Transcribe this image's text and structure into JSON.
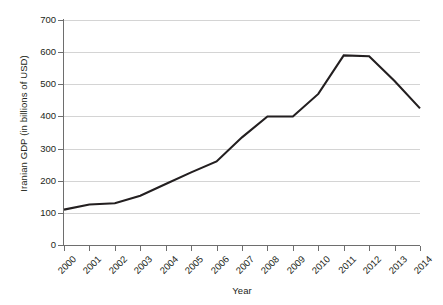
{
  "chart_data": {
    "type": "line",
    "title": "",
    "xlabel": "Year",
    "ylabel": "Iranian GDP (in billions of USD)",
    "categories": [
      "2000",
      "2001",
      "2002",
      "2003",
      "2004",
      "2005",
      "2006",
      "2007",
      "2008",
      "2009",
      "2010",
      "2011",
      "2012",
      "2013",
      "2014"
    ],
    "x": [
      2000,
      2001,
      2002,
      2003,
      2004,
      2005,
      2006,
      2007,
      2008,
      2009,
      2010,
      2011,
      2012,
      2013,
      2014
    ],
    "values": [
      110,
      126,
      130,
      153,
      190,
      226,
      260,
      335,
      400,
      400,
      470,
      590,
      587,
      510,
      425
    ],
    "series": [
      {
        "name": "Iranian GDP",
        "values": [
          110,
          126,
          130,
          153,
          190,
          226,
          260,
          335,
          400,
          400,
          470,
          590,
          587,
          510,
          425
        ]
      }
    ],
    "ylim": [
      0,
      700
    ],
    "yticks": [
      0,
      100,
      200,
      300,
      400,
      500,
      600,
      700
    ],
    "ytick_labels": [
      "0",
      "100",
      "200",
      "300",
      "400",
      "500",
      "600",
      "700"
    ],
    "xlim": [
      2000,
      2014
    ],
    "grid": "horizontal",
    "legend": "none",
    "line_color": "#231f20",
    "grid_color": "#d4d4d4",
    "axis_color": "#6e6e6e",
    "background": "#ffffff"
  }
}
